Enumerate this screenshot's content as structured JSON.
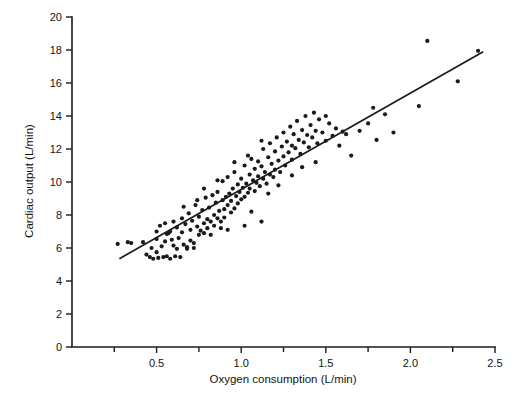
{
  "chart_data": {
    "type": "scatter",
    "title": "",
    "xlabel": "Oxygen consumption (L/min)",
    "ylabel": "Cardiac output (L/min)",
    "xlim": [
      0.0,
      2.5
    ],
    "ylim": [
      0,
      20
    ],
    "grid": false,
    "legend": "none",
    "x_ticks_major": [
      0.5,
      1.0,
      1.5,
      2.0,
      2.5
    ],
    "x_ticks_major_labels": [
      "0.5",
      "1.0",
      "1.5",
      "2.0",
      "2.5"
    ],
    "x_ticks_minor": [
      0.25,
      0.75,
      1.25,
      1.75,
      2.25
    ],
    "y_ticks": [
      0,
      2,
      4,
      6,
      8,
      10,
      12,
      14,
      16,
      18,
      20
    ],
    "y_tick_labels": [
      "0",
      "2",
      "4",
      "6",
      "8",
      "10",
      "12",
      "14",
      "16",
      "18",
      "20"
    ],
    "marker": "dot",
    "marker_color": "#1a1a1a",
    "marker_size_px": 2.1,
    "fit_line": {
      "label": "regression line",
      "color": "#1b1b1b",
      "x_start": 0.28,
      "y_start": 5.35,
      "x_end": 2.43,
      "y_end": 17.9,
      "slope": 5.84,
      "intercept": 3.72
    },
    "points": [
      [
        0.27,
        6.25
      ],
      [
        0.33,
        6.35
      ],
      [
        0.35,
        6.3
      ],
      [
        0.42,
        6.35
      ],
      [
        0.44,
        5.6
      ],
      [
        0.46,
        5.45
      ],
      [
        0.47,
        6.0
      ],
      [
        0.48,
        5.35
      ],
      [
        0.5,
        6.55
      ],
      [
        0.5,
        5.75
      ],
      [
        0.51,
        5.4
      ],
      [
        0.52,
        7.35
      ],
      [
        0.53,
        6.1
      ],
      [
        0.54,
        5.45
      ],
      [
        0.55,
        7.5
      ],
      [
        0.55,
        6.4
      ],
      [
        0.56,
        5.5
      ],
      [
        0.57,
        6.9
      ],
      [
        0.58,
        5.35
      ],
      [
        0.59,
        6.5
      ],
      [
        0.6,
        7.6
      ],
      [
        0.6,
        6.15
      ],
      [
        0.61,
        5.5
      ],
      [
        0.62,
        7.25
      ],
      [
        0.63,
        6.6
      ],
      [
        0.64,
        5.45
      ],
      [
        0.65,
        7.8
      ],
      [
        0.65,
        6.95
      ],
      [
        0.66,
        6.2
      ],
      [
        0.67,
        7.45
      ],
      [
        0.68,
        6.05
      ],
      [
        0.69,
        8.1
      ],
      [
        0.7,
        7.1
      ],
      [
        0.7,
        6.45
      ],
      [
        0.71,
        7.65
      ],
      [
        0.72,
        6.0
      ],
      [
        0.73,
        8.6
      ],
      [
        0.74,
        7.3
      ],
      [
        0.75,
        6.8
      ],
      [
        0.75,
        7.9
      ],
      [
        0.76,
        7.05
      ],
      [
        0.77,
        8.3
      ],
      [
        0.78,
        7.5
      ],
      [
        0.78,
        6.9
      ],
      [
        0.79,
        9.05
      ],
      [
        0.8,
        7.75
      ],
      [
        0.8,
        7.2
      ],
      [
        0.81,
        8.45
      ],
      [
        0.82,
        7.6
      ],
      [
        0.83,
        9.2
      ],
      [
        0.84,
        8.0
      ],
      [
        0.84,
        7.35
      ],
      [
        0.85,
        8.75
      ],
      [
        0.86,
        7.8
      ],
      [
        0.86,
        9.4
      ],
      [
        0.87,
        8.25
      ],
      [
        0.88,
        7.6
      ],
      [
        0.89,
        8.9
      ],
      [
        0.89,
        10.05
      ],
      [
        0.9,
        8.35
      ],
      [
        0.9,
        7.85
      ],
      [
        0.91,
        9.1
      ],
      [
        0.92,
        8.6
      ],
      [
        0.92,
        10.3
      ],
      [
        0.93,
        9.3
      ],
      [
        0.94,
        8.15
      ],
      [
        0.94,
        8.85
      ],
      [
        0.95,
        9.6
      ],
      [
        0.96,
        8.4
      ],
      [
        0.96,
        10.6
      ],
      [
        0.97,
        9.15
      ],
      [
        0.98,
        8.7
      ],
      [
        0.98,
        9.85
      ],
      [
        0.99,
        9.4
      ],
      [
        1.0,
        8.95
      ],
      [
        1.0,
        10.2
      ],
      [
        1.01,
        9.65
      ],
      [
        1.02,
        9.1
      ],
      [
        1.02,
        11.0
      ],
      [
        1.03,
        9.9
      ],
      [
        1.04,
        9.35
      ],
      [
        1.05,
        10.45
      ],
      [
        1.05,
        9.6
      ],
      [
        1.06,
        11.4
      ],
      [
        1.07,
        10.1
      ],
      [
        1.08,
        9.45
      ],
      [
        1.08,
        10.8
      ],
      [
        1.09,
        9.95
      ],
      [
        1.1,
        11.25
      ],
      [
        1.1,
        10.35
      ],
      [
        1.11,
        9.75
      ],
      [
        1.12,
        10.95
      ],
      [
        1.13,
        10.2
      ],
      [
        1.13,
        12.0
      ],
      [
        1.14,
        10.6
      ],
      [
        1.15,
        9.9
      ],
      [
        1.16,
        11.5
      ],
      [
        1.17,
        10.45
      ],
      [
        1.17,
        12.35
      ],
      [
        1.18,
        11.1
      ],
      [
        1.19,
        10.3
      ],
      [
        1.2,
        11.85
      ],
      [
        1.2,
        10.75
      ],
      [
        1.21,
        12.7
      ],
      [
        1.22,
        11.3
      ],
      [
        1.23,
        10.6
      ],
      [
        1.24,
        12.15
      ],
      [
        1.25,
        11.55
      ],
      [
        1.25,
        13.0
      ],
      [
        1.26,
        11.0
      ],
      [
        1.27,
        12.45
      ],
      [
        1.28,
        11.8
      ],
      [
        1.29,
        13.35
      ],
      [
        1.3,
        12.2
      ],
      [
        1.3,
        11.35
      ],
      [
        1.31,
        12.9
      ],
      [
        1.32,
        12.05
      ],
      [
        1.33,
        13.7
      ],
      [
        1.34,
        12.55
      ],
      [
        1.35,
        11.7
      ],
      [
        1.36,
        13.15
      ],
      [
        1.37,
        12.4
      ],
      [
        1.38,
        14.0
      ],
      [
        1.39,
        12.85
      ],
      [
        1.4,
        12.1
      ],
      [
        1.41,
        13.45
      ],
      [
        1.42,
        12.7
      ],
      [
        1.43,
        14.2
      ],
      [
        1.44,
        13.1
      ],
      [
        1.45,
        12.35
      ],
      [
        1.46,
        13.8
      ],
      [
        1.48,
        13.0
      ],
      [
        1.5,
        12.5
      ],
      [
        1.52,
        13.55
      ],
      [
        1.54,
        12.8
      ],
      [
        1.56,
        13.25
      ],
      [
        1.58,
        12.2
      ],
      [
        1.6,
        13.05
      ],
      [
        1.62,
        12.9
      ],
      [
        1.65,
        11.6
      ],
      [
        1.7,
        13.1
      ],
      [
        1.75,
        13.55
      ],
      [
        1.78,
        14.5
      ],
      [
        1.8,
        12.55
      ],
      [
        1.85,
        14.1
      ],
      [
        1.9,
        13.0
      ],
      [
        2.05,
        14.6
      ],
      [
        2.1,
        18.55
      ],
      [
        2.28,
        16.1
      ],
      [
        2.4,
        17.95
      ],
      [
        0.88,
        7.2
      ],
      [
        1.02,
        7.35
      ],
      [
        1.12,
        7.6
      ],
      [
        0.62,
        5.95
      ],
      [
        0.72,
        6.3
      ],
      [
        0.82,
        6.8
      ],
      [
        0.92,
        7.1
      ],
      [
        1.06,
        8.2
      ],
      [
        1.16,
        9.3
      ],
      [
        1.22,
        9.8
      ],
      [
        1.3,
        10.4
      ],
      [
        1.36,
        10.9
      ],
      [
        0.78,
        9.6
      ],
      [
        0.86,
        10.1
      ],
      [
        0.96,
        11.2
      ],
      [
        1.04,
        11.6
      ],
      [
        1.12,
        12.5
      ],
      [
        0.66,
        8.5
      ],
      [
        0.74,
        8.9
      ],
      [
        0.58,
        7.0
      ],
      [
        0.68,
        5.95
      ],
      [
        0.56,
        6.85
      ],
      [
        0.5,
        7.0
      ],
      [
        1.44,
        11.2
      ],
      [
        1.5,
        14.0
      ]
    ]
  }
}
